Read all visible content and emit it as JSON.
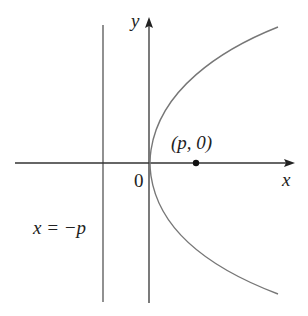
{
  "diagram": {
    "type": "parabola-focus-directrix",
    "colors": {
      "axis": "#333333",
      "curve": "#777777",
      "directrix": "#555555",
      "point": "#111111",
      "text": "#222222"
    },
    "axes": {
      "x_label": "x",
      "y_label": "y",
      "origin_label": "0"
    },
    "focus": {
      "label": "(p, 0)"
    },
    "directrix": {
      "label": "x = −p"
    }
  }
}
